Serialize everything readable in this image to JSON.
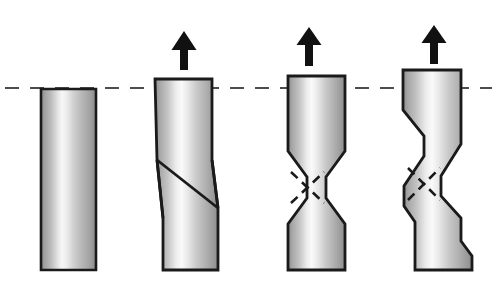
{
  "figure": {
    "background_color": "#ffffff",
    "outline_color": "#1a1a1a",
    "fill_light": "#ffffff",
    "fill_mid": "#b9b9b9",
    "fill_dark": "#8e8e8e",
    "arrow_color": "#111111",
    "baseline_color": "#7a7a7a",
    "dashed_line_color": "#4d4d4d"
  },
  "reference_line": {
    "name": "original-gauge-height-dashed-line",
    "y": 88,
    "x_start": 5,
    "x_end": 492,
    "dash_pattern": "14 11",
    "stroke_width": 2.2
  },
  "baseline": {
    "name": "ground-baseline",
    "y": 271,
    "x_start": 13,
    "x_end": 483,
    "stroke_width": 2.4
  },
  "specimens": [
    {
      "id": "specimen-1",
      "label": "undeformed cylinder",
      "stage": 1,
      "has_arrow": false,
      "top_y": 89,
      "bottom_y": 270,
      "left_x": 41,
      "right_x": 96,
      "outline_points": "41,89 96,89 96,270 41,270",
      "dashed_bands": []
    },
    {
      "id": "specimen-2",
      "label": "shear offset cylinder",
      "stage": 2,
      "has_arrow": true,
      "arrow": {
        "cx": 184,
        "tip_y": 31,
        "tail_y": 70,
        "head_w": 25,
        "head_h": 18,
        "shaft_w": 8
      },
      "top_y": 79,
      "bottom_y": 270,
      "left_x": 155,
      "right_x": 212,
      "outline_points": "155,79 212,79 212,160 218,208 218,270 163,270 163,218 157,160",
      "dashed_bands": []
    },
    {
      "id": "specimen-3",
      "label": "necked cylinder with crossed shear bands",
      "stage": 3,
      "has_arrow": true,
      "arrow": {
        "cx": 309,
        "tip_y": 27,
        "tail_y": 66,
        "head_w": 25,
        "head_h": 18,
        "shaft_w": 8
      },
      "top_y": 76,
      "bottom_y": 270,
      "left_x": 288,
      "right_x": 345,
      "outline_points": "288,76 345,76 345,151 326,177 326,198 345,224 345,270 288,270 288,224 307,198 307,177 288,151",
      "dashed_bands": [
        {
          "name": "shear-band-upper-left-to-lower-right",
          "x1": 291,
          "y1": 172,
          "x2": 324,
          "y2": 203
        },
        {
          "name": "shear-band-lower-left-to-upper-right",
          "x1": 291,
          "y1": 203,
          "x2": 324,
          "y2": 172
        }
      ]
    },
    {
      "id": "specimen-4",
      "label": "severely necked cylinder with offset shear bands",
      "stage": 4,
      "has_arrow": true,
      "arrow": {
        "cx": 434,
        "tip_y": 25,
        "tail_y": 64,
        "head_w": 25,
        "head_h": 18,
        "shaft_w": 8
      },
      "top_y": 70,
      "bottom_y": 270,
      "left_x": 403,
      "right_x": 461,
      "outline_points": "403,70 461,70 461,144 441,176 441,196 461,218 461,241 472,256 472,270 415,270 415,222 404,206 404,186 424,156 424,136 403,110",
      "dashed_bands": [
        {
          "name": "shear-band-upper-left-to-lower-right",
          "x1": 408,
          "y1": 168,
          "x2": 440,
          "y2": 200
        },
        {
          "name": "shear-band-lower-left-to-upper-right",
          "x1": 408,
          "y1": 200,
          "x2": 440,
          "y2": 168
        }
      ]
    }
  ],
  "arrows": [
    {
      "name": "tensile-load-arrow-1",
      "for": "specimen-2",
      "direction": "up"
    },
    {
      "name": "tensile-load-arrow-2",
      "for": "specimen-3",
      "direction": "up"
    },
    {
      "name": "tensile-load-arrow-3",
      "for": "specimen-4",
      "direction": "up"
    }
  ]
}
